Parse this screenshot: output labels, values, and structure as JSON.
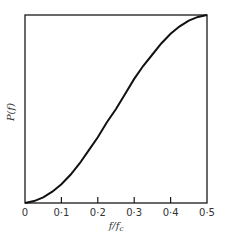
{
  "chart_data": {
    "type": "line",
    "title": "",
    "xlabel": "f / f_c",
    "ylabel": "P(f)",
    "xlim": [
      0,
      0.5
    ],
    "ylim": [
      0,
      1
    ],
    "grid": false,
    "legend": null,
    "x_ticks": [
      "0",
      "0·1",
      "0·2",
      "0·3",
      "0·4",
      "0·5"
    ],
    "y_ticks": [],
    "series": [
      {
        "name": "P(f)",
        "x": [
          0,
          0.025,
          0.05,
          0.075,
          0.1,
          0.125,
          0.15,
          0.175,
          0.2,
          0.225,
          0.25,
          0.275,
          0.3,
          0.325,
          0.35,
          0.375,
          0.4,
          0.425,
          0.45,
          0.475,
          0.5
        ],
        "values": [
          0,
          0.01,
          0.03,
          0.06,
          0.1,
          0.15,
          0.21,
          0.28,
          0.35,
          0.43,
          0.5,
          0.58,
          0.66,
          0.73,
          0.79,
          0.85,
          0.9,
          0.94,
          0.97,
          0.99,
          1.0
        ]
      }
    ]
  }
}
